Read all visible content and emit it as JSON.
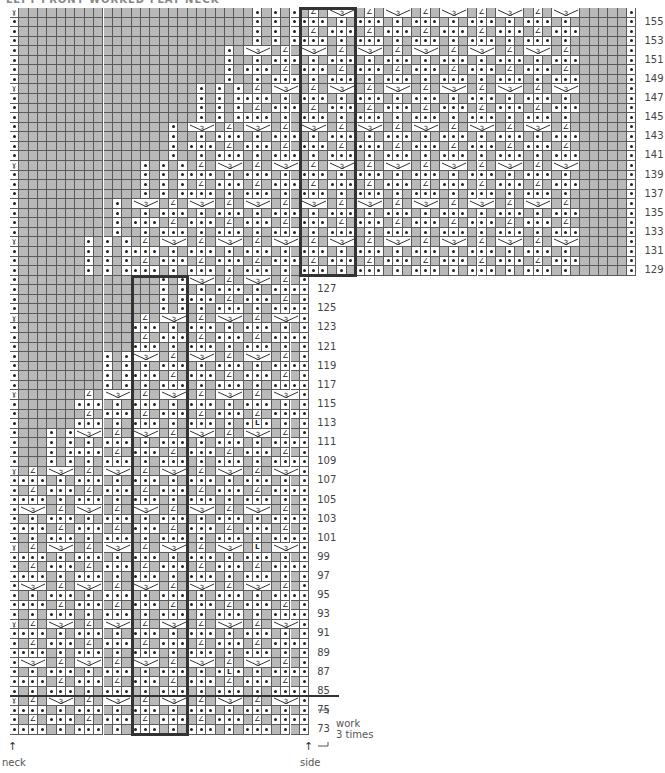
{
  "title": "LEFT FRONT WORKED FLAT NECK",
  "grid": {
    "left": 10,
    "top": 8,
    "cell_w": 9.35,
    "cell_h": 9.56,
    "upper_cols": 67,
    "lower_cols": 32,
    "upper_rows": 28,
    "lower_rows": 48
  },
  "colors": {
    "gray": "#b9b9b9",
    "line": "#5a5a5a",
    "box": "#333333"
  },
  "symbols": {
    "purl": "dot",
    "decrease": "∠",
    "slip": "ɣ",
    "three_into_one": "3",
    "make_one": "L"
  },
  "row_labels_upper": [
    "155",
    "153",
    "151",
    "149",
    "147",
    "145",
    "143",
    "141",
    "139",
    "137",
    "135",
    "133",
    "131",
    "129"
  ],
  "row_labels_lower": [
    "127",
    "125",
    "123",
    "121",
    "119",
    "117",
    "115",
    "113",
    "111",
    "109",
    "107",
    "105",
    "103",
    "101",
    "99",
    "97",
    "95",
    "93",
    "91",
    "89",
    "87",
    "85",
    "75",
    "73"
  ],
  "repeat_note": {
    "line1": "work",
    "line2": "3 times"
  },
  "edge_labels": {
    "neck": "neck",
    "side": "side"
  },
  "repeat_boxes": [
    {
      "name": "upper-repeat-box",
      "col": 31,
      "row": 0,
      "cols": 6,
      "rows": 28
    },
    {
      "name": "lower-repeat-box",
      "col": 13,
      "row": 28,
      "cols": 6,
      "rows": 48
    }
  ],
  "ml_marks": [
    {
      "row": 43,
      "col": 26
    },
    {
      "row": 56,
      "col": 26
    },
    {
      "row": 69,
      "col": 23
    }
  ]
}
